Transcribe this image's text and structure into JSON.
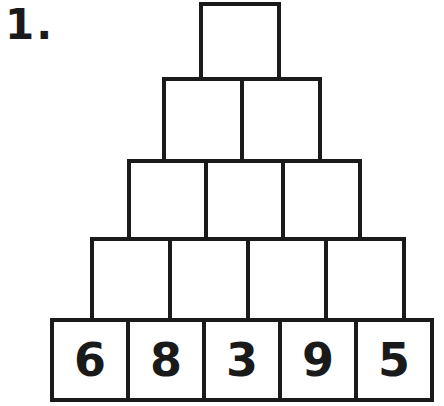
{
  "problem": {
    "number_label": "1."
  },
  "pyramid": {
    "line_color": "#1a1a1a",
    "cell_background": "#ffffff",
    "rows": [
      {
        "cells": [
          ""
        ]
      },
      {
        "cells": [
          "",
          ""
        ]
      },
      {
        "cells": [
          "",
          "",
          ""
        ]
      },
      {
        "cells": [
          "",
          "",
          "",
          ""
        ]
      },
      {
        "cells": [
          "6",
          "8",
          "3",
          "9",
          "5"
        ]
      }
    ]
  }
}
